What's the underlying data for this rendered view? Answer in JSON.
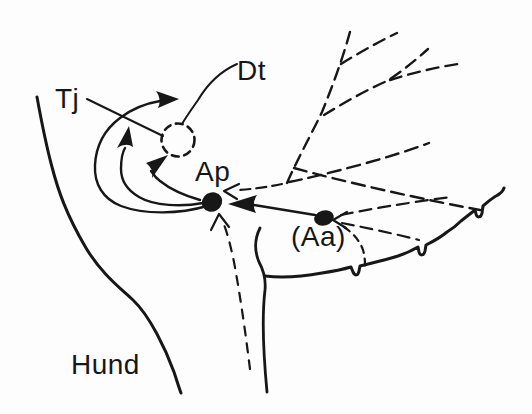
{
  "figure": {
    "kind": "hand-drawn schematic map diagram",
    "labels": {
      "dt": "Dt",
      "tj": "Tj",
      "ap": "Ap",
      "aa": "(Aa)",
      "hund": "Hund"
    },
    "markers": {
      "ap_site": "filled-dot",
      "aa_site": "filled-dot",
      "dt_site": "dashed-circle"
    },
    "colors": {
      "ink": "#171717",
      "background": "#fdfdfd"
    }
  }
}
